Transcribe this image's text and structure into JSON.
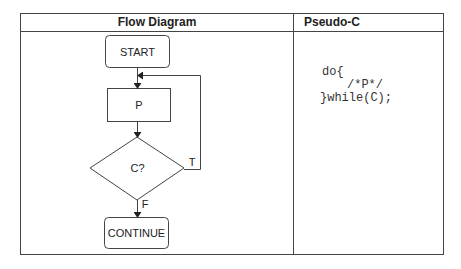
{
  "table": {
    "headers": [
      "Flow Diagram",
      "Pseudo-C"
    ]
  },
  "flow": {
    "nodes": [
      {
        "id": "start",
        "type": "terminal",
        "label": "START"
      },
      {
        "id": "p",
        "type": "process",
        "label": "P"
      },
      {
        "id": "c",
        "type": "decision",
        "label": "C?"
      },
      {
        "id": "continue",
        "type": "terminal",
        "label": "CONTINUE"
      }
    ],
    "edges": [
      {
        "from": "start",
        "to": "p",
        "label": ""
      },
      {
        "from": "p",
        "to": "c",
        "label": ""
      },
      {
        "from": "c",
        "to": "p",
        "label": "T"
      },
      {
        "from": "c",
        "to": "continue",
        "label": "F"
      }
    ],
    "labels": {
      "true": "T",
      "false": "F"
    }
  },
  "code": {
    "lines": [
      "do{",
      "/*P*/",
      "}while(C);"
    ]
  },
  "colors": {
    "line": "#444444",
    "text": "#222222"
  }
}
